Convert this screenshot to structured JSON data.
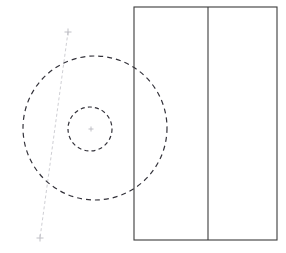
{
  "document": {
    "title": "Engineering line drawing",
    "description": "Orthographic CAD-style sketch: two concentric dashed circles overlapping a solid rectangle that is split by a vertical divider, plus a faint inclined construction axis with cross tick marks.",
    "background_color": "#ffffff",
    "width": 286,
    "height": 253
  },
  "palette": {
    "solid_stroke": "#3b3b3b",
    "dashed_stroke": "#33323a",
    "construction_stroke": "#cfcfd4",
    "marker_stroke": "#b9b9c0",
    "background": "#ffffff"
  },
  "shapes": {
    "rectangle": {
      "label": "Rectangle outline",
      "x": 134,
      "y": 7,
      "width": 143,
      "height": 233,
      "stroke": "#3b3b3b",
      "stroke_width": 1.1,
      "fill": "none"
    },
    "divider": {
      "label": "Vertical divider line",
      "x": 208,
      "y1": 7,
      "y2": 240,
      "stroke": "#3b3b3b",
      "stroke_width": 1.1
    },
    "outer_circle": {
      "label": "Outer dashed circle",
      "cx": 95,
      "cy": 128,
      "r": 72,
      "stroke": "#33323a",
      "stroke_width": 1.2,
      "dash": "5 4",
      "fill": "none"
    },
    "inner_circle": {
      "label": "Inner dashed circle",
      "cx": 90,
      "cy": 129,
      "r": 22,
      "stroke": "#33323a",
      "stroke_width": 1.2,
      "dash": "4 3.2",
      "fill": "none"
    },
    "construction_axis": {
      "label": "Inclined construction axis",
      "x1": 68,
      "y1": 32,
      "x2": 40,
      "y2": 238,
      "stroke": "#cfcfd4",
      "stroke_width": 1,
      "dash": "3 2.5"
    },
    "markers": [
      {
        "name": "top-cross-marker",
        "cx": 68,
        "cy": 32,
        "size": 7
      },
      {
        "name": "center-cross-marker",
        "cx": 91,
        "cy": 129,
        "size": 5
      },
      {
        "name": "bottom-cross-marker",
        "cx": 40,
        "cy": 238,
        "size": 7
      }
    ]
  }
}
